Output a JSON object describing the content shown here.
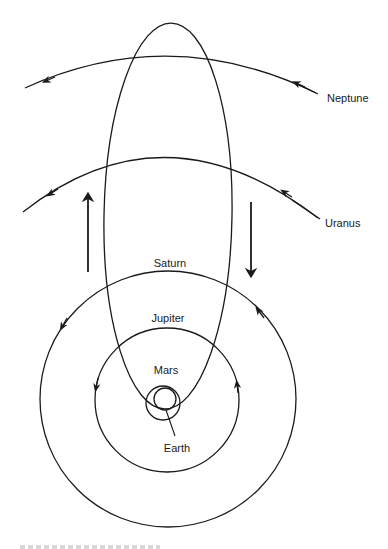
{
  "diagram": {
    "colors": {
      "line": "#1a1a1a",
      "background": "#ffffff"
    },
    "labels": {
      "neptune": "Neptune",
      "uranus": "Uranus",
      "saturn": "Saturn",
      "jupiter": "Jupiter",
      "mars": "Mars",
      "earth": "Earth"
    },
    "orbits": [
      {
        "name": "Neptune",
        "type": "arc",
        "direction": "counter-clockwise"
      },
      {
        "name": "Uranus",
        "type": "arc",
        "direction": "counter-clockwise"
      },
      {
        "name": "Saturn",
        "type": "circle",
        "cx": 168,
        "cy": 399,
        "r": 128,
        "direction": "counter-clockwise"
      },
      {
        "name": "Jupiter",
        "type": "circle",
        "cx": 167,
        "cy": 400,
        "r": 72,
        "direction": "counter-clockwise"
      },
      {
        "name": "Mars",
        "type": "circle",
        "cx": 163,
        "cy": 403,
        "r": 17
      },
      {
        "name": "Earth",
        "type": "circle",
        "cx": 165,
        "cy": 399,
        "r": 11
      },
      {
        "name": "Comet",
        "type": "ellipse",
        "cx": 168,
        "cy": 216,
        "rx": 64,
        "ry": 193
      }
    ],
    "motion_arrows": [
      {
        "name": "outbound",
        "direction": "up"
      },
      {
        "name": "inbound",
        "direction": "down"
      }
    ]
  }
}
